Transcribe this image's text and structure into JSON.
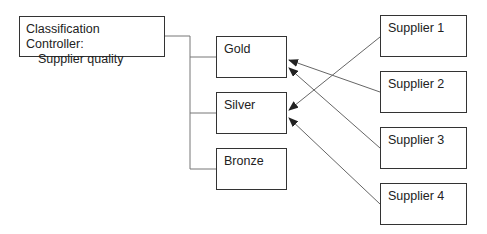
{
  "controller": {
    "line1": "Classification Controller:",
    "line2": "Supplier quality"
  },
  "classes": [
    {
      "label": "Gold"
    },
    {
      "label": "Silver"
    },
    {
      "label": "Bronze"
    }
  ],
  "suppliers": [
    {
      "label": "Supplier 1",
      "classified_as": "Silver"
    },
    {
      "label": "Supplier 2",
      "classified_as": "Gold"
    },
    {
      "label": "Supplier 3",
      "classified_as": "Gold"
    },
    {
      "label": "Supplier 4",
      "classified_as": "Silver"
    }
  ],
  "colors": {
    "line": "#555555",
    "border": "#333333",
    "background": "#ffffff"
  }
}
